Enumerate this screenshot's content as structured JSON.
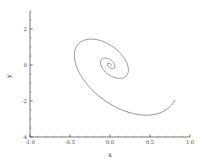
{
  "chart_data": {
    "type": "line",
    "title": "",
    "xlabel": "x",
    "ylabel": "y",
    "xlim": [
      -1.0,
      1.0
    ],
    "ylim": [
      -4,
      3
    ],
    "xticks": [
      -1.0,
      -0.5,
      0.0,
      0.5,
      1.0
    ],
    "xtick_labels": [
      "-1.0",
      "-0.5",
      "0.0",
      "0.5",
      "1.0"
    ],
    "yticks": [
      -4,
      -2,
      0,
      2
    ],
    "ytick_labels": [
      "-4",
      "-2",
      "0",
      "2"
    ],
    "grid": false,
    "legend": null,
    "series": [
      {
        "name": "spiral trajectory",
        "description": "damped spiral converging to origin",
        "key_points": [
          {
            "x": 0.99,
            "y": -0.94
          },
          {
            "x": 0.31,
            "y": -4.0
          },
          {
            "x": -0.56,
            "y": 0.17
          },
          {
            "x": -0.17,
            "y": 2.11
          },
          {
            "x": 0.28,
            "y": 0.0
          },
          {
            "x": 0.11,
            "y": -1.17
          },
          {
            "x": -0.17,
            "y": 0.22
          },
          {
            "x": -0.06,
            "y": 0.61
          },
          {
            "x": 0.0,
            "y": 0.0
          }
        ]
      }
    ]
  }
}
